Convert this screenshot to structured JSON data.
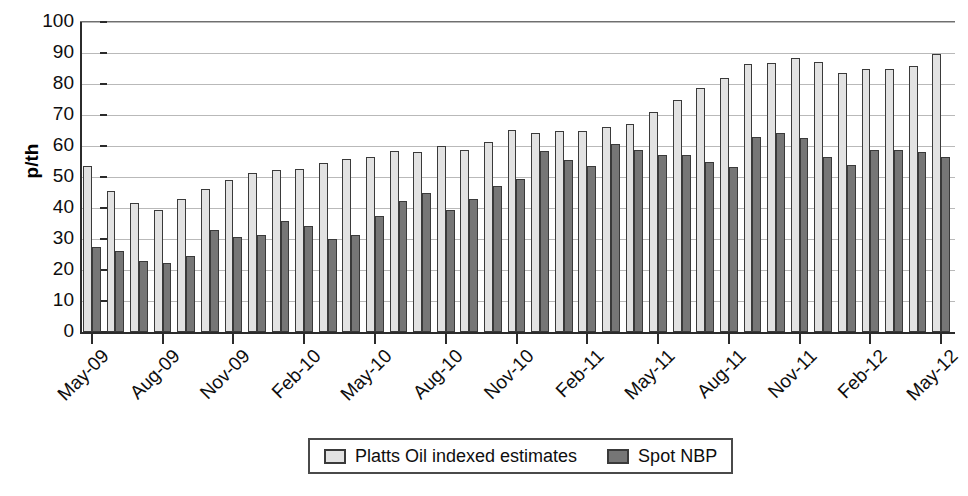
{
  "chart_data": {
    "type": "bar",
    "title": "",
    "subtitle": "",
    "xlabel": "",
    "ylabel": "p/th",
    "ylim": [
      0,
      100
    ],
    "ytick_step": 10,
    "yticks": [
      0,
      10,
      20,
      30,
      40,
      50,
      60,
      70,
      80,
      90,
      100
    ],
    "grid": true,
    "legend_position": "bottom-center",
    "categories": [
      "May-09",
      "Jun-09",
      "Jul-09",
      "Aug-09",
      "Sep-09",
      "Oct-09",
      "Nov-09",
      "Dec-09",
      "Jan-10",
      "Feb-10",
      "Mar-10",
      "Apr-10",
      "May-10",
      "Jun-10",
      "Jul-10",
      "Aug-10",
      "Sep-10",
      "Oct-10",
      "Nov-10",
      "Dec-10",
      "Jan-11",
      "Feb-11",
      "Mar-11",
      "Apr-11",
      "May-11",
      "Jun-11",
      "Jul-11",
      "Aug-11",
      "Sep-11",
      "Oct-11",
      "Nov-11",
      "Dec-11",
      "Jan-12",
      "Feb-12",
      "Mar-12",
      "Apr-12",
      "May-12"
    ],
    "tick_labels": [
      "May-09",
      "Aug-09",
      "Nov-09",
      "Feb-10",
      "May-10",
      "Aug-10",
      "Nov-10",
      "Feb-11",
      "May-11",
      "Aug-11",
      "Nov-11",
      "Feb-12",
      "May-12"
    ],
    "tick_label_indices": [
      0,
      3,
      6,
      9,
      12,
      15,
      18,
      21,
      24,
      27,
      30,
      33,
      36
    ],
    "series": [
      {
        "name": "Platts Oil indexed estimates",
        "color": "#e2e2e2",
        "values": [
          53.5,
          45.5,
          41.5,
          39.5,
          42.8,
          46.0,
          49.0,
          51.2,
          52.2,
          52.5,
          54.5,
          55.8,
          56.5,
          58.5,
          58.2,
          60.0,
          58.8,
          61.2,
          65.2,
          64.2,
          65.0,
          65.0,
          66.0,
          67.2,
          71.0,
          75.0,
          78.8,
          81.8,
          86.5,
          86.8,
          88.5,
          87.2,
          83.5,
          84.8,
          84.8,
          85.8,
          89.8
        ]
      },
      {
        "name": "Spot NBP",
        "color": "#767676",
        "values": [
          27.5,
          26.0,
          22.8,
          22.4,
          24.4,
          33.0,
          30.6,
          31.2,
          35.8,
          34.2,
          30.1,
          31.2,
          37.5,
          42.2,
          44.8,
          39.5,
          42.8,
          47.0,
          49.2,
          58.5,
          55.5,
          53.5,
          60.5,
          58.8,
          57.0,
          57.2,
          54.8,
          53.2,
          62.8,
          64.2,
          62.5,
          56.5,
          54.0,
          58.8,
          58.8,
          58.0,
          56.5
        ]
      }
    ]
  },
  "axis": {
    "y_title": "p/th",
    "y_tick_labels": [
      "100",
      "90",
      "80",
      "70",
      "60",
      "50",
      "40",
      "30",
      "20",
      "10",
      "0"
    ]
  },
  "legend": {
    "items": [
      {
        "label": "Platts Oil indexed estimates",
        "swatch": "light"
      },
      {
        "label": "Spot NBP",
        "swatch": "dark"
      }
    ]
  }
}
